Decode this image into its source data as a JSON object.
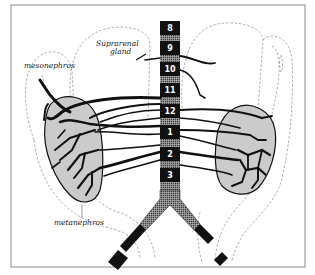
{
  "figure": {
    "labels": {
      "suprarenal": [
        "Suprarenal",
        "gland"
      ],
      "mesonephros": "mesonephros",
      "metanephros": "metanephros"
    },
    "vertebral_segments": [
      "8",
      "9",
      "10",
      "11",
      "12",
      "1",
      "2",
      "3"
    ],
    "colors": {
      "ink": "#111111",
      "hatch": "#9a9a9a",
      "kidney_fill": "#d8d8d8",
      "frame": "#8a8a8a",
      "dash": "#9a9a9a"
    }
  }
}
